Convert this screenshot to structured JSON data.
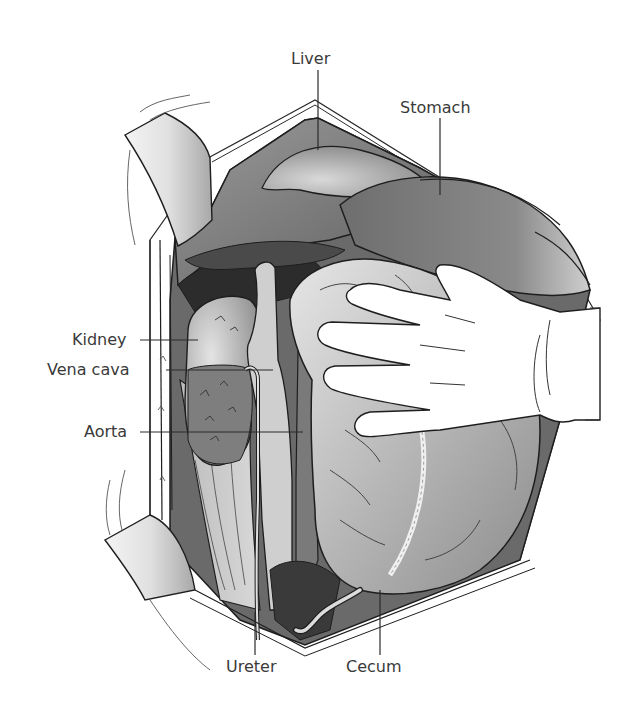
{
  "figure": {
    "labels": [
      {
        "id": "liver",
        "text": "Liver"
      },
      {
        "id": "stomach",
        "text": "Stomach"
      },
      {
        "id": "kidney",
        "text": "Kidney"
      },
      {
        "id": "vena_cava",
        "text": "Vena cava"
      },
      {
        "id": "aorta",
        "text": "Aorta"
      },
      {
        "id": "ureter",
        "text": "Ureter"
      },
      {
        "id": "cecum",
        "text": "Cecum"
      }
    ],
    "colors": {
      "background": "#ffffff",
      "label_text": "#3a3a3a",
      "leader_line": "#2a2a2a",
      "outline": "#1e1e1e",
      "organ_dark": "#3c3c3c",
      "organ_mid": "#7a7a7a",
      "organ_light": "#b5b5b5",
      "tissue_pale": "#d8d8d8",
      "glove": "#ffffff"
    }
  }
}
